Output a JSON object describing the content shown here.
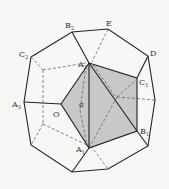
{
  "diagram": {
    "type": "geometry-figure",
    "colors": {
      "edge": "#222222",
      "dashed": "#555555",
      "shade": "#c8c8c8",
      "background": "#f7f7f5"
    },
    "labels": {
      "B2": {
        "main": "B",
        "sub": "2"
      },
      "E": {
        "main": "E"
      },
      "C2": {
        "main": "C",
        "sub": "2"
      },
      "D": {
        "main": "D"
      },
      "A2": {
        "main": "A",
        "sub": "2"
      },
      "C1": {
        "main": "C",
        "sub": "1"
      },
      "A3": {
        "main": "A",
        "sub": "3"
      },
      "O": {
        "main": "O"
      },
      "a": {
        "main": "a"
      },
      "B1": {
        "main": "B",
        "sub": "1"
      },
      "A1": {
        "main": "A",
        "sub": "1"
      }
    }
  }
}
